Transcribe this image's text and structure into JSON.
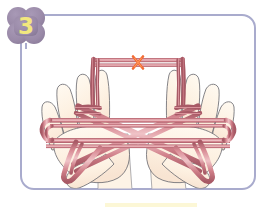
{
  "illustration": {
    "title": "Cat's cradle string figure step",
    "step_badge": {
      "number": "3",
      "shape": "flower-badge",
      "fill_color": "#9a8aa8",
      "text_color": "#f2e77e"
    },
    "frame": {
      "border_color": "#a9abcd",
      "background_color": "#ffffff",
      "corner_radius_px": 14
    },
    "marker": {
      "name": "x-mark",
      "label": "×",
      "color": "#f26a33",
      "position": "top-center-string",
      "meaning": "pick-up-point"
    },
    "hands": [
      {
        "side": "left",
        "skin_color": "#fdf2e4",
        "outline_color": "#6e6e74",
        "fingers": 4,
        "thumb": true
      },
      {
        "side": "right",
        "skin_color": "#fdf2e4",
        "outline_color": "#6e6e74",
        "fingers": 4,
        "thumb": true
      }
    ],
    "string": {
      "color": "#c97b85",
      "highlight_color": "#e8b9bd",
      "shade_color": "#a85a66",
      "pattern": "double-x-crossing",
      "segments": [
        "top-horizontal-span",
        "upper-left-diagonal",
        "upper-right-diagonal",
        "lower-left-diagonal",
        "lower-right-diagonal",
        "left-palm-loop",
        "right-palm-loop",
        "left-thumb-loop",
        "right-thumb-loop"
      ]
    },
    "bottom_strip_color": "#fbf6cf"
  }
}
